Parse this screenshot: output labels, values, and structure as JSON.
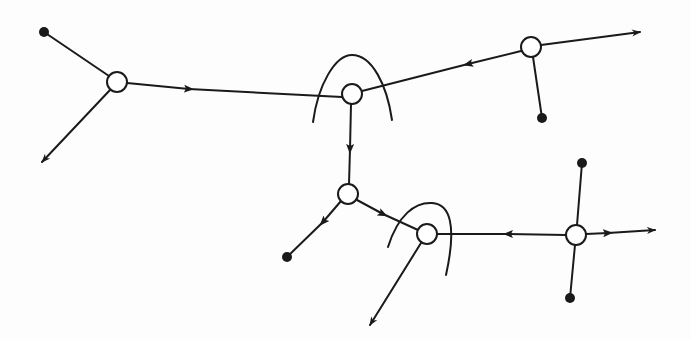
{
  "diagram": {
    "type": "directed-network",
    "stroke_color": "#1a1a1a",
    "background": "#fdfdfd",
    "nodes": [
      {
        "id": "A",
        "kind": "open",
        "x": 117,
        "y": 82
      },
      {
        "id": "B",
        "kind": "open",
        "x": 352,
        "y": 94,
        "arc": true
      },
      {
        "id": "C",
        "kind": "open",
        "x": 531,
        "y": 47
      },
      {
        "id": "D",
        "kind": "open",
        "x": 348,
        "y": 194
      },
      {
        "id": "E",
        "kind": "open",
        "x": 427,
        "y": 234,
        "arc": true
      },
      {
        "id": "F",
        "kind": "open",
        "x": 576,
        "y": 235
      },
      {
        "id": "t1",
        "kind": "terminal",
        "x": 44,
        "y": 32
      },
      {
        "id": "t2",
        "kind": "terminal",
        "x": 542,
        "y": 118
      },
      {
        "id": "t3",
        "kind": "terminal",
        "x": 287,
        "y": 257
      },
      {
        "id": "t4",
        "kind": "terminal",
        "x": 582,
        "y": 163
      },
      {
        "id": "t5",
        "kind": "terminal",
        "x": 570,
        "y": 298
      }
    ],
    "edges": [
      {
        "from": "t1",
        "to": "A",
        "arrow": "none"
      },
      {
        "from": "A",
        "to": "out1",
        "arrow": "end",
        "end": [
          42,
          162
        ]
      },
      {
        "from": "A",
        "to": "B",
        "arrow": "mid"
      },
      {
        "from": "C",
        "to": "B",
        "arrow": "mid"
      },
      {
        "from": "C",
        "to": "out2",
        "arrow": "end",
        "end": [
          640,
          32
        ]
      },
      {
        "from": "C",
        "to": "t2",
        "arrow": "none"
      },
      {
        "from": "B",
        "to": "D",
        "arrow": "mid"
      },
      {
        "from": "D",
        "to": "t3",
        "arrow": "mid"
      },
      {
        "from": "D",
        "to": "E",
        "arrow": "mid"
      },
      {
        "from": "E",
        "to": "out3",
        "arrow": "end",
        "end": [
          370,
          325
        ]
      },
      {
        "from": "F",
        "to": "E",
        "arrow": "mid"
      },
      {
        "from": "F",
        "to": "out4",
        "arrow": "mid-and-end",
        "end": [
          655,
          230
        ]
      },
      {
        "from": "t4",
        "to": "F",
        "arrow": "none"
      },
      {
        "from": "F",
        "to": "t5",
        "arrow": "none"
      }
    ],
    "arcs": [
      {
        "around": "B",
        "description": "semicircular arc over node B"
      },
      {
        "around": "E",
        "description": "semicircular arc over node E"
      }
    ]
  }
}
